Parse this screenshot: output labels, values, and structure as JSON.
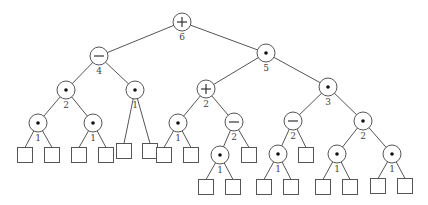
{
  "diagram": {
    "type": "expression-tree",
    "nodes": [
      {
        "id": "n0",
        "kind": "op",
        "op": "+",
        "x": 182,
        "y": 22,
        "label": "6"
      },
      {
        "id": "n1",
        "kind": "op",
        "op": "-",
        "x": 99,
        "y": 56,
        "label": "4"
      },
      {
        "id": "n2",
        "kind": "op",
        "op": "*",
        "x": 266,
        "y": 53,
        "label": "5"
      },
      {
        "id": "n3",
        "kind": "op",
        "op": "*",
        "x": 66,
        "y": 90,
        "label": "2"
      },
      {
        "id": "n4",
        "kind": "op",
        "op": "*",
        "x": 135,
        "y": 90,
        "label": "1"
      },
      {
        "id": "n5",
        "kind": "op",
        "op": "+",
        "x": 206,
        "y": 89,
        "label": "2"
      },
      {
        "id": "n6",
        "kind": "op",
        "op": "*",
        "x": 328,
        "y": 87,
        "label": "3"
      },
      {
        "id": "n7",
        "kind": "op",
        "op": "*",
        "x": 38,
        "y": 123,
        "label": "1"
      },
      {
        "id": "n8",
        "kind": "op",
        "op": "*",
        "x": 93,
        "y": 123,
        "label": "1"
      },
      {
        "id": "l0",
        "kind": "leaf",
        "x": 124,
        "y": 151
      },
      {
        "id": "l1",
        "kind": "leaf",
        "x": 150,
        "y": 151
      },
      {
        "id": "n9",
        "kind": "op",
        "op": "*",
        "x": 178,
        "y": 123,
        "label": "1"
      },
      {
        "id": "n10",
        "kind": "op",
        "op": "-",
        "x": 234,
        "y": 122,
        "label": "2"
      },
      {
        "id": "n11",
        "kind": "op",
        "op": "-",
        "x": 293,
        "y": 121,
        "label": "2"
      },
      {
        "id": "n12",
        "kind": "op",
        "op": "*",
        "x": 363,
        "y": 121,
        "label": "2"
      },
      {
        "id": "l2",
        "kind": "leaf",
        "x": 25,
        "y": 155
      },
      {
        "id": "l3",
        "kind": "leaf",
        "x": 52,
        "y": 155
      },
      {
        "id": "l4",
        "kind": "leaf",
        "x": 79,
        "y": 155
      },
      {
        "id": "l5",
        "kind": "leaf",
        "x": 106,
        "y": 155
      },
      {
        "id": "l6",
        "kind": "leaf",
        "x": 164,
        "y": 155
      },
      {
        "id": "l7",
        "kind": "leaf",
        "x": 191,
        "y": 155
      },
      {
        "id": "n13",
        "kind": "op",
        "op": "*",
        "x": 220,
        "y": 155,
        "label": "1"
      },
      {
        "id": "l8",
        "kind": "leaf",
        "x": 249,
        "y": 155
      },
      {
        "id": "n14",
        "kind": "op",
        "op": "*",
        "x": 278,
        "y": 154,
        "label": "1"
      },
      {
        "id": "l9",
        "kind": "leaf",
        "x": 306,
        "y": 155
      },
      {
        "id": "n15",
        "kind": "op",
        "op": "*",
        "x": 337,
        "y": 154,
        "label": "1"
      },
      {
        "id": "n16",
        "kind": "op",
        "op": "*",
        "x": 392,
        "y": 154,
        "label": "1"
      },
      {
        "id": "l10",
        "kind": "leaf",
        "x": 206,
        "y": 187
      },
      {
        "id": "l11",
        "kind": "leaf",
        "x": 233,
        "y": 187
      },
      {
        "id": "l12",
        "kind": "leaf",
        "x": 264,
        "y": 187
      },
      {
        "id": "l13",
        "kind": "leaf",
        "x": 291,
        "y": 187
      },
      {
        "id": "l14",
        "kind": "leaf",
        "x": 323,
        "y": 187
      },
      {
        "id": "l15",
        "kind": "leaf",
        "x": 350,
        "y": 187
      },
      {
        "id": "l16",
        "kind": "leaf",
        "x": 378,
        "y": 186
      },
      {
        "id": "l17",
        "kind": "leaf",
        "x": 405,
        "y": 186
      }
    ],
    "edges": [
      [
        "n0",
        "n1"
      ],
      [
        "n0",
        "n2"
      ],
      [
        "n1",
        "n3"
      ],
      [
        "n1",
        "n4"
      ],
      [
        "n2",
        "n5"
      ],
      [
        "n2",
        "n6"
      ],
      [
        "n3",
        "n7"
      ],
      [
        "n3",
        "n8"
      ],
      [
        "n4",
        "l0"
      ],
      [
        "n4",
        "l1"
      ],
      [
        "n5",
        "n9"
      ],
      [
        "n5",
        "n10"
      ],
      [
        "n6",
        "n11"
      ],
      [
        "n6",
        "n12"
      ],
      [
        "n7",
        "l2"
      ],
      [
        "n7",
        "l3"
      ],
      [
        "n8",
        "l4"
      ],
      [
        "n8",
        "l5"
      ],
      [
        "n9",
        "l6"
      ],
      [
        "n9",
        "l7"
      ],
      [
        "n10",
        "n13"
      ],
      [
        "n10",
        "l8"
      ],
      [
        "n11",
        "n14"
      ],
      [
        "n11",
        "l9"
      ],
      [
        "n12",
        "n15"
      ],
      [
        "n12",
        "n16"
      ],
      [
        "n13",
        "l10"
      ],
      [
        "n13",
        "l11"
      ],
      [
        "n14",
        "l12"
      ],
      [
        "n14",
        "l13"
      ],
      [
        "n15",
        "l14"
      ],
      [
        "n15",
        "l15"
      ],
      [
        "n16",
        "l16"
      ],
      [
        "n16",
        "l17"
      ]
    ]
  }
}
